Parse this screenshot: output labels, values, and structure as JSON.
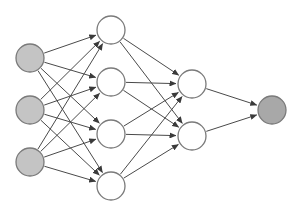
{
  "diagram": {
    "type": "neural-network",
    "width": 299,
    "height": 217,
    "colors": {
      "background": "#ffffff",
      "edge": "#4a4a4a",
      "node_border": "#7a7a7a",
      "input_fill": "#c4c4c4",
      "hidden_fill": "#ffffff",
      "output_fill": "#a8a8a8"
    },
    "node_radius": 14,
    "layers": [
      {
        "name": "input",
        "fill": "input_fill",
        "nodes": [
          {
            "x": 30,
            "y": 58
          },
          {
            "x": 30,
            "y": 110
          },
          {
            "x": 30,
            "y": 162
          }
        ]
      },
      {
        "name": "hidden-1",
        "fill": "hidden_fill",
        "nodes": [
          {
            "x": 111,
            "y": 30
          },
          {
            "x": 111,
            "y": 82
          },
          {
            "x": 111,
            "y": 134
          },
          {
            "x": 111,
            "y": 186
          }
        ]
      },
      {
        "name": "hidden-2",
        "fill": "hidden_fill",
        "nodes": [
          {
            "x": 192,
            "y": 84
          },
          {
            "x": 192,
            "y": 136
          }
        ]
      },
      {
        "name": "output",
        "fill": "output_fill",
        "nodes": [
          {
            "x": 272,
            "y": 110
          }
        ]
      }
    ],
    "connectivity": "fully-connected"
  }
}
